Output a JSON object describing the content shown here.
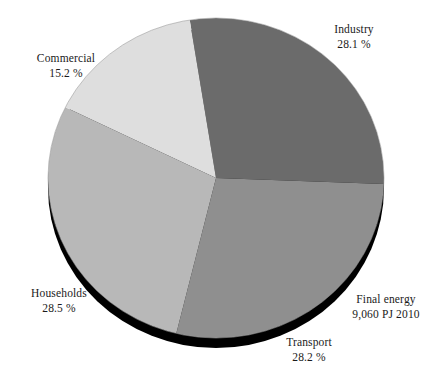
{
  "chart_data": {
    "type": "pie",
    "title": "",
    "subtitle": "",
    "total_label": "Final energy",
    "total_value": "9,060 PJ 2010",
    "unit": "%",
    "legend_position": "around-slices",
    "grid": false,
    "categories": [
      "Industry",
      "Transport",
      "Households",
      "Commercial"
    ],
    "values": [
      28.1,
      28.2,
      28.5,
      15.2
    ],
    "slices": [
      {
        "name": "Industry",
        "value": 28.1,
        "value_label": "28.1 %",
        "color": "#6b6b6b"
      },
      {
        "name": "Transport",
        "value": 28.2,
        "value_label": "28.2 %",
        "color": "#8f8f8f"
      },
      {
        "name": "Households",
        "value": 28.5,
        "value_label": "28.5 %",
        "color": "#b8b8b8"
      },
      {
        "name": "Commercial",
        "value": 15.2,
        "value_label": "15.2 %",
        "color": "#dedede"
      }
    ],
    "colors": {
      "industry": "#6b6b6b",
      "transport": "#8f8f8f",
      "households": "#b8b8b8",
      "commercial": "#dedede",
      "shadow": "#000000",
      "text": "#1a1a1a",
      "background": "#ffffff"
    }
  },
  "labels": {
    "industry": {
      "name": "Industry",
      "value": "28.1 %"
    },
    "commercial": {
      "name": "Commercial",
      "value": "15.2 %"
    },
    "households": {
      "name": "Households",
      "value": "28.5 %"
    },
    "transport": {
      "name": "Transport",
      "value": "28.2 %"
    },
    "final": {
      "name": "Final energy",
      "value": "9,060 PJ 2010"
    }
  }
}
